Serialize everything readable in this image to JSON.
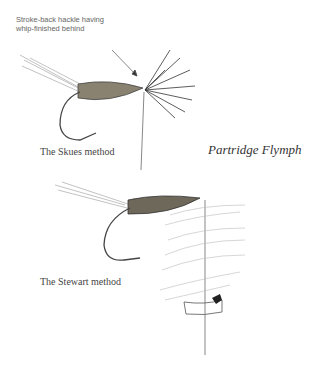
{
  "annotation": {
    "line1": "Stroke-back hackle having",
    "line2": "whip-finished behind"
  },
  "captions": {
    "skues": "The Skues method",
    "stewart": "The Stewart method"
  },
  "title": "Partridge Flymph",
  "colors": {
    "ink": "#333333",
    "light_ink": "#999999",
    "background": "#ffffff"
  }
}
